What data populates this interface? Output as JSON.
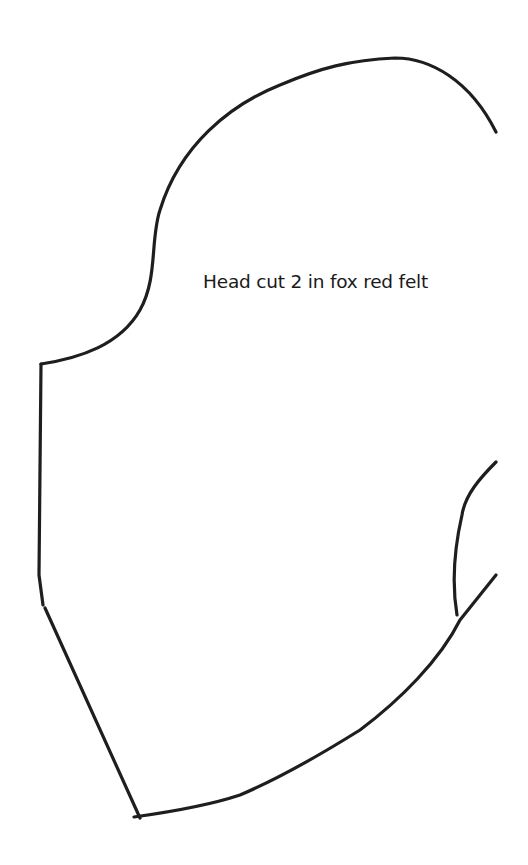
{
  "pattern": {
    "piece_label": "Head cut 2 in fox red felt",
    "line_color": "#1e1e1e",
    "background": "#ffffff"
  }
}
